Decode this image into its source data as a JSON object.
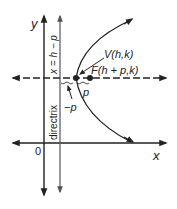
{
  "diagram": {
    "type": "parabola-horizontal",
    "axes": {
      "x_label": "x",
      "y_label": "y",
      "origin_label": "0"
    },
    "directrix": {
      "label": "directrix",
      "equation": "x = h − p"
    },
    "vertex": {
      "label": "V(h,k)"
    },
    "focus": {
      "label": "F(h + p,k)"
    },
    "distance_labels": {
      "positive": "p",
      "negative": "−p"
    },
    "colors": {
      "stroke": "#222222",
      "directrix": "#555555",
      "background": "#ffffff"
    }
  }
}
